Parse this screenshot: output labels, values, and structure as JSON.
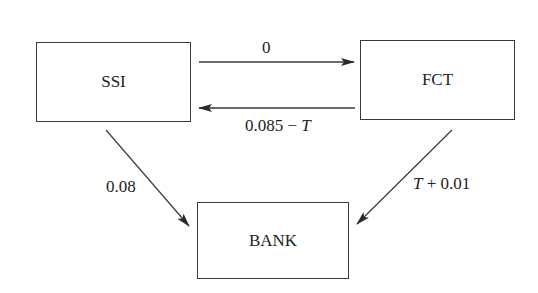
{
  "diagram": {
    "nodes": [
      {
        "id": "ssi",
        "label": "SSI"
      },
      {
        "id": "fct",
        "label": "FCT"
      },
      {
        "id": "bank",
        "label": "BANK"
      }
    ],
    "edges": [
      {
        "from": "SSI",
        "to": "FCT",
        "label": "0"
      },
      {
        "from": "FCT",
        "to": "SSI",
        "label_prefix": "0.085 − ",
        "label_var": "T"
      },
      {
        "from": "SSI",
        "to": "BANK",
        "label": "0.08"
      },
      {
        "from": "FCT",
        "to": "BANK",
        "label_var": "T",
        "label_suffix": " + 0.01"
      }
    ],
    "colors": {
      "stroke": "#3a3a3a",
      "text": "#222222",
      "background": "#ffffff"
    }
  }
}
